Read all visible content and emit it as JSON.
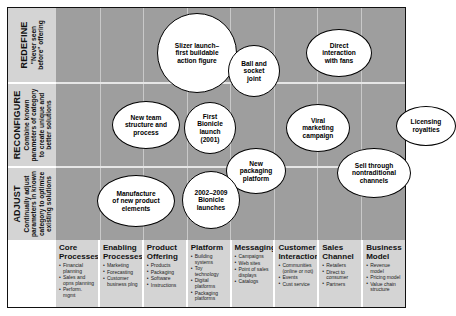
{
  "chart_data": {
    "type": "scatter",
    "title": "",
    "ylabel": "Degree of innovation",
    "xlabel": "Area of innovation",
    "grid": true,
    "rows": [
      {
        "id": "redefine",
        "title": "REDEFINE",
        "subtitle": "\"Never seen\nbefore\" offering"
      },
      {
        "id": "reconfigure",
        "title": "RECONFIGURE",
        "subtitle": "Combine known\nparameters of category\nto create unique and\nbetter solutions"
      },
      {
        "id": "adjust",
        "title": "ADJUST",
        "subtitle": "Continually adjust\nparameters in known\ncategory to optimize\nexisting solutions"
      }
    ],
    "categories": [
      {
        "title": "Core\nProcesses",
        "items": [
          "Financial planning",
          "Sales and opns planning",
          "Perform. mgmt"
        ]
      },
      {
        "title": "Enabling\nProcesses",
        "items": [
          "Marketing",
          "Forecasting",
          "Customer business plng"
        ]
      },
      {
        "title": "Product\nOffering",
        "items": [
          "Products",
          "Packaging",
          "Software",
          "Instructions"
        ]
      },
      {
        "title": "Platform",
        "items": [
          "Building systems",
          "Toy technology",
          "Digital platforms",
          "Packaging platforms"
        ]
      },
      {
        "title": "Messaging",
        "items": [
          "Campaigns",
          "Web sites",
          "Point of sales displays",
          "Catalogs"
        ]
      },
      {
        "title": "Customer\nInteraction",
        "items": [
          "Communities (online or not)",
          "Events",
          "Cust service"
        ]
      },
      {
        "title": "Sales\nChannel",
        "items": [
          "Retailers",
          "Direct to consumer",
          "Partners"
        ]
      },
      {
        "title": "Business\nModel",
        "items": [
          "Revenue model",
          "Pricing model",
          "Value chain structure"
        ]
      }
    ],
    "points": [
      {
        "label": "Slizer launch–\nfirst buildable\naction figure",
        "row": "redefine",
        "category": "Product Offering",
        "cx": 141,
        "cy": 45,
        "rx": 40,
        "ry": 40
      },
      {
        "label": "Ball and\nsocket\njoint",
        "row": "redefine",
        "category": "Platform",
        "cx": 198,
        "cy": 63,
        "rx": 26,
        "ry": 26
      },
      {
        "label": "Direct\ninteraction\nwith fans",
        "row": "redefine",
        "category": "Customer Interaction",
        "cx": 283,
        "cy": 45,
        "rx": 33,
        "ry": 24
      },
      {
        "label": "New team\nstructure and\nprocess",
        "row": "reconfigure",
        "category": "Core Processes",
        "cx": 90,
        "cy": 117,
        "rx": 34,
        "ry": 24
      },
      {
        "label": "First\nBionicle\nlaunch\n(2001)",
        "row": "reconfigure",
        "category": "Product Offering",
        "cx": 154,
        "cy": 120,
        "rx": 26,
        "ry": 26
      },
      {
        "label": "Viral\nmarketing\ncampaign",
        "row": "reconfigure",
        "category": "Messaging",
        "cx": 262,
        "cy": 120,
        "rx": 32,
        "ry": 24
      },
      {
        "label": "Licensing\nroyalties",
        "row": "reconfigure",
        "category": "Business Model",
        "cx": 370,
        "cy": 118,
        "rx": 30,
        "ry": 20
      },
      {
        "label": "New\npackaging\nplatform",
        "row": "reconfigure",
        "category": "Platform",
        "cx": 200,
        "cy": 163,
        "rx": 30,
        "ry": 23
      },
      {
        "label": "Sell through\nnontraditional\nchannels",
        "row": "adjust",
        "category": "Sales Channel",
        "cx": 318,
        "cy": 165,
        "rx": 37,
        "ry": 25
      },
      {
        "label": "Manufacture\nof new product\nelements",
        "row": "adjust",
        "category": "Core Processes",
        "cx": 80,
        "cy": 193,
        "rx": 39,
        "ry": 26
      },
      {
        "label": "2002–2009\nBionicle\nlaunches",
        "row": "adjust",
        "category": "Product Offering",
        "cx": 155,
        "cy": 192,
        "rx": 29,
        "ry": 29
      }
    ]
  }
}
